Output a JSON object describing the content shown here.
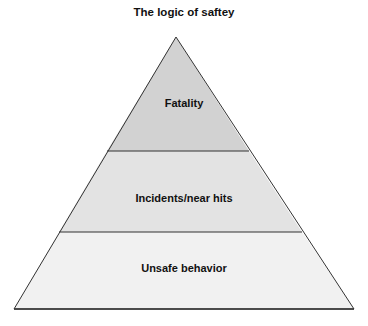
{
  "title": "The logic of saftey",
  "levels": [
    {
      "label": "Fatality",
      "fill": "#d2d2d2"
    },
    {
      "label": "Incidents/near hits",
      "fill": "#e3e3e3"
    },
    {
      "label": "Unsafe behavior",
      "fill": "#f1f1f1"
    }
  ],
  "stroke_color": "#333333"
}
